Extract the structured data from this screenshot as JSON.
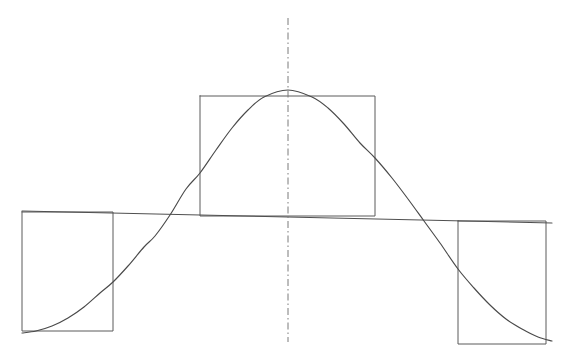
{
  "figure": {
    "title": "Hand-drawn Gaussian bell curve with step-function rectangles",
    "width": 562,
    "height": 361,
    "background_color": "#ffffff"
  },
  "style": {
    "curve_color": "#4a4a4a",
    "rect_color": "#5a5a5a",
    "baseline_color": "#4f4f4f",
    "axis_color": "#7a7a7a",
    "curve_width": 1.15,
    "rect_width": 1.0,
    "baseline_width": 1.1,
    "axis_width": 1.0,
    "axis_dash": "7 3 1.5 3"
  },
  "chart_data": {
    "type": "line",
    "title": "",
    "subtitle": "",
    "xlabel": "",
    "ylabel": "",
    "xlim": [
      0,
      562
    ],
    "ylim": [
      361,
      0
    ],
    "grid": false,
    "legend": "none",
    "annotations": [],
    "series": [
      {
        "name": "bell-curve",
        "kind": "gaussian",
        "peak_x": 288,
        "peak_y": 90,
        "baseline_y_at_peak": 216,
        "amplitude": 254,
        "sigma": 96,
        "x_start": 22,
        "x_end": 552,
        "x": [
          22,
          36,
          52,
          68,
          84,
          100,
          113,
          128,
          144,
          155,
          170,
          186,
          200,
          216,
          232,
          248,
          264,
          288,
          312,
          328,
          344,
          360,
          375,
          392,
          408,
          424,
          440,
          458,
          474,
          490,
          506,
          522,
          538,
          552
        ],
        "y": [
          333,
          331,
          326,
          318,
          307,
          293,
          282,
          266,
          247,
          236,
          215,
          189,
          173,
          150,
          128,
          110,
          97,
          90,
          97,
          108,
          124,
          143,
          158,
          178,
          199,
          221,
          243,
          269,
          288,
          305,
          319,
          329,
          337,
          341
        ]
      },
      {
        "name": "baseline",
        "kind": "line",
        "x": [
          22,
          552
        ],
        "y": [
          211,
          223
        ]
      },
      {
        "name": "centerline",
        "kind": "dash-dot-vertical",
        "x": [
          288,
          288
        ],
        "y": [
          18,
          342
        ]
      }
    ],
    "rectangles": [
      {
        "name": "left-step-rect",
        "x0": 22,
        "x1": 113,
        "y_top": 212,
        "y_bottom": 331,
        "level": "low"
      },
      {
        "name": "center-step-rect",
        "x0": 200,
        "x1": 375,
        "y_top": 96,
        "y_bottom": 216,
        "level": "high"
      },
      {
        "name": "right-step-rect",
        "x0": 458,
        "x1": 546,
        "y_top": 221,
        "y_bottom": 344,
        "level": "low"
      }
    ]
  }
}
